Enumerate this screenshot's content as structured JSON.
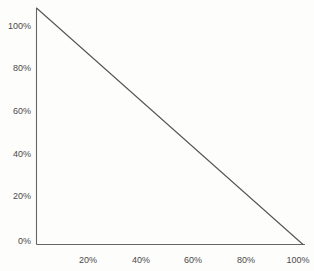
{
  "chart_data": {
    "type": "line",
    "title": "",
    "subtitle": "",
    "xlabel": "",
    "ylabel": "",
    "x": [
      0,
      100
    ],
    "values": [
      100,
      0
    ],
    "series": [
      {
        "name": "",
        "x": [
          0,
          100
        ],
        "values": [
          100,
          0
        ]
      }
    ],
    "xlim": [
      0,
      100
    ],
    "ylim": [
      0,
      100
    ],
    "x_tick_labels": [
      "20%",
      "40%",
      "60%",
      "80%",
      "100%"
    ],
    "x_tick_values": [
      20,
      40,
      60,
      80,
      100
    ],
    "y_tick_labels": [
      "0%",
      "20%",
      "40%",
      "60%",
      "80%",
      "100%"
    ],
    "y_tick_values": [
      0,
      20,
      40,
      60,
      80,
      100
    ],
    "grid": false,
    "legend": false,
    "legend_position": "none",
    "line_color": "#555555",
    "axis_color": "#666666",
    "background_color": "#fdfdfb",
    "tick_label_color": "#4a4a4a"
  }
}
